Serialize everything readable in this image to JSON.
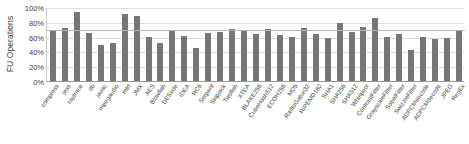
{
  "chart_data": {
    "type": "bar",
    "title": "",
    "xlabel": "",
    "ylabel": "FU Operations",
    "ylim": [
      0,
      100
    ],
    "yticks": [
      "0%",
      "20%",
      "40%",
      "60%",
      "80%",
      "100%"
    ],
    "ytick_values": [
      0,
      20,
      40,
      60,
      80,
      100
    ],
    "grid": true,
    "legend": "none",
    "average_line": 70,
    "unit": "%",
    "categories": [
      "compress",
      "jess",
      "raytrace",
      "db",
      "javac",
      "mpegaudio",
      "mtrt",
      "JMX",
      "AES",
      "Blowfish",
      "DESede",
      "IDEA",
      "RC6",
      "Serpent",
      "Skipjack",
      "Twofish",
      "XTEA",
      "BLAKE256",
      "CubeHash512",
      "ECOH256",
      "MD5",
      "RadioGatun32",
      "RIPEMD160",
      "SHA1",
      "SHA256",
      "SHA512",
      "Whirlpool",
      "ContrastFilter",
      "GrayscaleFilter",
      "SobelFilter",
      "SwizzleFilter",
      "ADPCMencode",
      "ADPCMdecode",
      "JPEG",
      "RegEx"
    ],
    "values": [
      69,
      71,
      93,
      65,
      48,
      51,
      91,
      88,
      59,
      52,
      68,
      61,
      45,
      65,
      66,
      70,
      68,
      63,
      70,
      62,
      59,
      72,
      63,
      58,
      78,
      66,
      73,
      85,
      60,
      64,
      42,
      60,
      57,
      58,
      68
    ],
    "ylabel_title": "FU Operations"
  }
}
